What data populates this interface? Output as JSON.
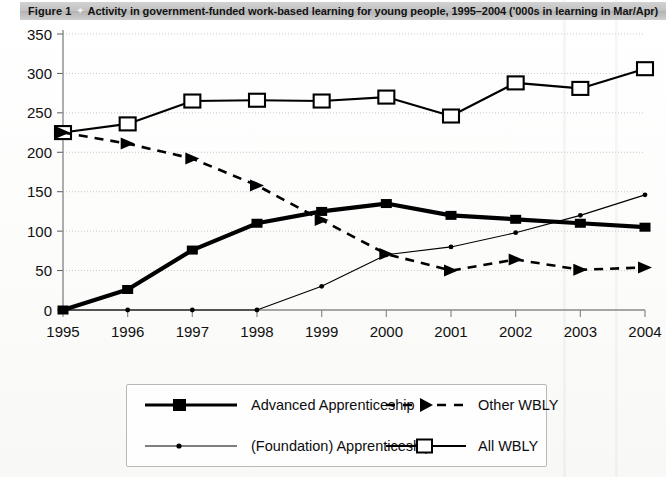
{
  "header": {
    "figure_label": "Figure 1",
    "separator_icon": "diamond-icon",
    "title": "Activity in government-funded work-based learning for young people, 1995–2004 ('000s in learning in Mar/Apr)"
  },
  "legend": {
    "items": [
      {
        "label": "Advanced Apprenticeship",
        "marker": "filled-square-marker",
        "style": "thick-solid"
      },
      {
        "label": "Other WBLY",
        "marker": "filled-triangle-marker",
        "style": "dashed"
      },
      {
        "label": "(Foundation) Apprenticeship",
        "marker": "small-dot-marker",
        "style": "thin-solid"
      },
      {
        "label": "All WBLY",
        "marker": "open-square-marker",
        "style": "solid"
      }
    ]
  },
  "chart_data": {
    "type": "line",
    "title": "Activity in government-funded work-based learning for young people, 1995–2004 ('000s in learning in Mar/Apr)",
    "xlabel": "",
    "ylabel": "",
    "categories": [
      "1995",
      "1996",
      "1997",
      "1998",
      "1999",
      "2000",
      "2001",
      "2002",
      "2003",
      "2004"
    ],
    "x": [
      1995,
      1996,
      1997,
      1998,
      1999,
      2000,
      2001,
      2002,
      2003,
      2004
    ],
    "ylim": [
      0,
      350
    ],
    "yticks": [
      0,
      50,
      100,
      150,
      200,
      250,
      300,
      350
    ],
    "ytick_labels": [
      "0",
      "50",
      "100",
      "150",
      "200",
      "250",
      "300",
      "350"
    ],
    "xlim": [
      1995,
      2004
    ],
    "grid": "horizontal-dotted",
    "legend_position": "below-plot",
    "series": [
      {
        "name": "All WBLY",
        "marker": "open-square-marker",
        "style": "solid",
        "values": [
          225,
          236,
          265,
          266,
          265,
          270,
          246,
          288,
          281,
          306
        ]
      },
      {
        "name": "Other WBLY",
        "marker": "filled-triangle-marker",
        "style": "dashed",
        "values": [
          225,
          211,
          192,
          158,
          114,
          71,
          50,
          64,
          51,
          54
        ]
      },
      {
        "name": "Advanced Apprenticeship",
        "marker": "filled-square-marker",
        "style": "thick-solid",
        "values": [
          0,
          26,
          76,
          110,
          125,
          135,
          120,
          115,
          110,
          105
        ]
      },
      {
        "name": "(Foundation) Apprenticeship",
        "marker": "small-dot-marker",
        "style": "thin-solid",
        "values": [
          0,
          0,
          0,
          0,
          30,
          70,
          80,
          98,
          120,
          146
        ]
      }
    ]
  }
}
